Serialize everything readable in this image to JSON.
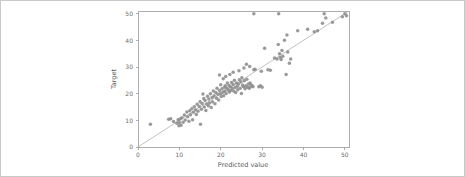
{
  "figure": {
    "background_color": "#ffffff",
    "border_color": "#c9c9c9",
    "point_color": "#8c8c8c",
    "line_color": "#a8a8a8",
    "axis_color": "#9a9a9a"
  },
  "axis": {
    "x_title": "Predicted value",
    "y_title": "Target",
    "x_ticks": [
      "0",
      "10",
      "20",
      "30",
      "40",
      "50"
    ],
    "y_ticks": [
      "0",
      "10",
      "20",
      "30",
      "40",
      "50"
    ]
  },
  "chart_data": {
    "type": "scatter",
    "title": "",
    "xlabel": "Predicted value",
    "ylabel": "Target",
    "xlim": [
      0,
      51
    ],
    "ylim": [
      0,
      51
    ],
    "grid": false,
    "legend": null,
    "xticks": [
      0,
      10,
      20,
      30,
      40,
      50
    ],
    "yticks": [
      0,
      10,
      20,
      30,
      40,
      50
    ],
    "reference_line": {
      "type": "identity",
      "from": [
        0,
        0
      ],
      "to": [
        51,
        51
      ],
      "label": "y = x"
    },
    "series": [
      {
        "name": "predictions",
        "marker": "circle",
        "color": "#8c8c8c",
        "points": [
          [
            3.0,
            8.5
          ],
          [
            7.4,
            10.4
          ],
          [
            7.9,
            10.6
          ],
          [
            8.6,
            9.6
          ],
          [
            9.4,
            8.9
          ],
          [
            9.7,
            10.2
          ],
          [
            9.9,
            8.0
          ],
          [
            10.0,
            9.2
          ],
          [
            10.2,
            10.5
          ],
          [
            10.4,
            8.2
          ],
          [
            10.6,
            11.0
          ],
          [
            10.9,
            9.3
          ],
          [
            11.2,
            12.0
          ],
          [
            11.4,
            10.1
          ],
          [
            11.8,
            13.1
          ],
          [
            12.0,
            11.3
          ],
          [
            12.3,
            9.7
          ],
          [
            12.5,
            13.6
          ],
          [
            12.7,
            12.1
          ],
          [
            13.0,
            14.3
          ],
          [
            13.2,
            10.2
          ],
          [
            13.4,
            13.0
          ],
          [
            13.6,
            15.1
          ],
          [
            13.9,
            14.0
          ],
          [
            14.1,
            12.2
          ],
          [
            14.3,
            16.0
          ],
          [
            14.5,
            13.4
          ],
          [
            14.8,
            15.2
          ],
          [
            15.0,
            17.0
          ],
          [
            15.1,
            8.5
          ],
          [
            15.3,
            14.2
          ],
          [
            15.5,
            16.3
          ],
          [
            15.7,
            19.9
          ],
          [
            15.9,
            18.2
          ],
          [
            16.0,
            15.0
          ],
          [
            16.2,
            17.4
          ],
          [
            16.4,
            13.7
          ],
          [
            16.6,
            16.1
          ],
          [
            16.8,
            19.0
          ],
          [
            17.0,
            15.5
          ],
          [
            17.1,
            18.0
          ],
          [
            17.3,
            16.5
          ],
          [
            17.5,
            20.0
          ],
          [
            17.7,
            14.8
          ],
          [
            17.9,
            18.6
          ],
          [
            18.0,
            17.0
          ],
          [
            18.2,
            21.0
          ],
          [
            18.4,
            19.2
          ],
          [
            18.6,
            16.2
          ],
          [
            18.8,
            20.4
          ],
          [
            19.0,
            18.3
          ],
          [
            19.1,
            22.0
          ],
          [
            19.3,
            19.8
          ],
          [
            19.5,
            17.6
          ],
          [
            19.7,
            21.2
          ],
          [
            19.9,
            20.0
          ],
          [
            20.0,
            23.3
          ],
          [
            20.1,
            18.9
          ],
          [
            20.3,
            21.8
          ],
          [
            20.5,
            20.5
          ],
          [
            20.7,
            19.2
          ],
          [
            20.9,
            22.4
          ],
          [
            21.0,
            21.0
          ],
          [
            21.1,
            23.0
          ],
          [
            21.3,
            20.1
          ],
          [
            21.5,
            22.0
          ],
          [
            21.6,
            24.0
          ],
          [
            21.8,
            21.4
          ],
          [
            22.0,
            23.1
          ],
          [
            22.1,
            20.6
          ],
          [
            22.3,
            22.6
          ],
          [
            22.4,
            21.2
          ],
          [
            22.6,
            24.2
          ],
          [
            22.8,
            22.0
          ],
          [
            23.0,
            23.4
          ],
          [
            23.1,
            21.0
          ],
          [
            23.3,
            25.0
          ],
          [
            23.5,
            22.3
          ],
          [
            23.6,
            20.4
          ],
          [
            23.8,
            24.0
          ],
          [
            24.0,
            22.8
          ],
          [
            24.1,
            21.5
          ],
          [
            24.3,
            23.6
          ],
          [
            24.5,
            25.2
          ],
          [
            24.7,
            22.0
          ],
          [
            24.9,
            24.4
          ],
          [
            25.0,
            20.1
          ],
          [
            25.1,
            26.0
          ],
          [
            25.3,
            23.2
          ],
          [
            25.5,
            22.6
          ],
          [
            25.7,
            24.8
          ],
          [
            25.9,
            21.8
          ],
          [
            26.1,
            23.0
          ],
          [
            26.3,
            25.4
          ],
          [
            26.5,
            22.4
          ],
          [
            26.7,
            23.6
          ],
          [
            26.9,
            22.0
          ],
          [
            27.1,
            24.0
          ],
          [
            27.3,
            22.8
          ],
          [
            27.5,
            23.2
          ],
          [
            27.8,
            22.6
          ],
          [
            28.0,
            29.0
          ],
          [
            28.3,
            29.2
          ],
          [
            28.0,
            50.0
          ],
          [
            19.7,
            27.0
          ],
          [
            20.6,
            25.6
          ],
          [
            21.2,
            26.4
          ],
          [
            22.2,
            27.2
          ],
          [
            23.0,
            28.0
          ],
          [
            24.4,
            28.6
          ],
          [
            25.6,
            29.6
          ],
          [
            26.2,
            31.0
          ],
          [
            27.0,
            30.2
          ],
          [
            29.2,
            22.6
          ],
          [
            29.6,
            23.0
          ],
          [
            30.0,
            22.4
          ],
          [
            29.8,
            28.4
          ],
          [
            30.6,
            37.0
          ],
          [
            31.4,
            29.0
          ],
          [
            32.0,
            28.8
          ],
          [
            33.0,
            33.4
          ],
          [
            33.6,
            33.0
          ],
          [
            33.9,
            38.4
          ],
          [
            34.0,
            50.0
          ],
          [
            34.2,
            35.0
          ],
          [
            34.4,
            33.6
          ],
          [
            34.6,
            32.8
          ],
          [
            34.8,
            36.2
          ],
          [
            35.0,
            34.0
          ],
          [
            35.4,
            40.0
          ],
          [
            35.8,
            27.2
          ],
          [
            36.0,
            42.0
          ],
          [
            36.2,
            35.6
          ],
          [
            36.6,
            31.4
          ],
          [
            36.9,
            33.0
          ],
          [
            38.6,
            43.6
          ],
          [
            41.0,
            44.2
          ],
          [
            42.6,
            43.2
          ],
          [
            43.4,
            43.6
          ],
          [
            44.6,
            46.4
          ],
          [
            45.0,
            50.0
          ],
          [
            45.4,
            48.4
          ],
          [
            47.0,
            46.8
          ],
          [
            49.4,
            48.8
          ],
          [
            50.0,
            50.0
          ],
          [
            50.4,
            49.2
          ]
        ]
      }
    ]
  }
}
